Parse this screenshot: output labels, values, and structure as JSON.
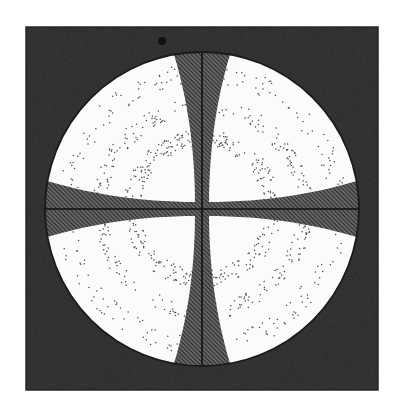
{
  "figure": {
    "type": "conoscopic-interference-figure",
    "colors": {
      "page_background": "#ffffff",
      "field_background": "#3c3c3c",
      "field_border": "#2a2a2a",
      "disc_fill": "#fbfbfb",
      "disc_outline": "#1a1a1a",
      "isogyre_fill": "#6e6e6e",
      "isogyre_hatch": "#2e2e2e",
      "crosshair": "#111111",
      "ring_dots": "#4a4a4a",
      "blemish": "#111111"
    },
    "field": {
      "x": 26,
      "y": 27,
      "width": 352,
      "height": 363
    },
    "disc": {
      "cx": 202,
      "cy": 209,
      "r": 157
    },
    "isogyres": {
      "center_half_width": 7,
      "edge_half_width": 30,
      "hatch_angle_deg": -45,
      "hatch_spacing": 3
    },
    "crosshair": {
      "stroke_width": 1.6
    },
    "rings": [
      {
        "name": "inner-ring",
        "r_inner": 62,
        "r_outer": 79,
        "density": 0.55
      },
      {
        "name": "middle-ring",
        "r_inner": 95,
        "r_outer": 111,
        "density": 0.35
      },
      {
        "name": "outer-ring",
        "r_inner": 126,
        "r_outer": 146,
        "density": 0.18
      }
    ],
    "blemish": {
      "cx": 162,
      "cy": 41,
      "r": 4
    }
  }
}
